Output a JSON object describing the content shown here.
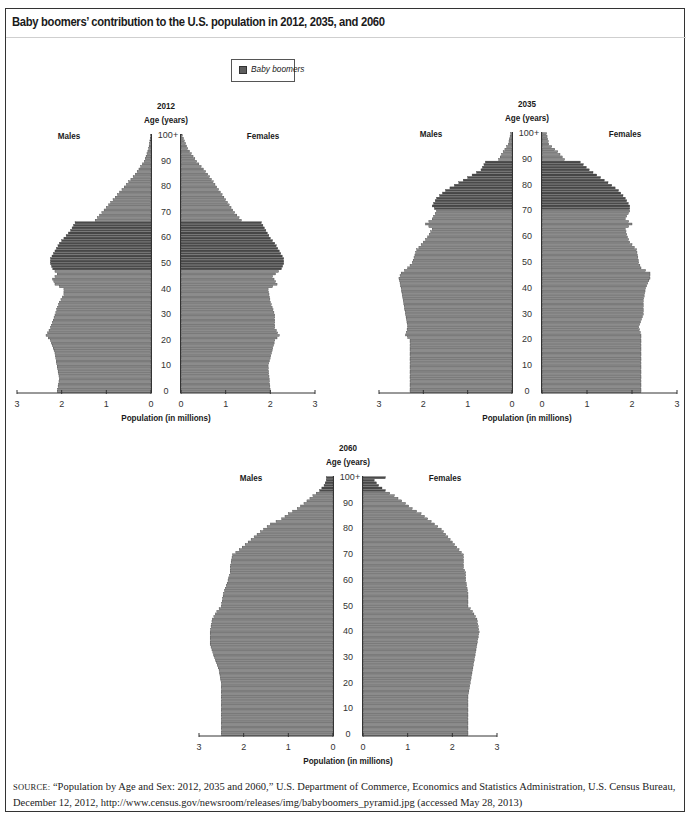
{
  "figure": {
    "title": "Baby boomers’ contribution to the U.S. population in 2012, 2035, and 2060",
    "legend": {
      "label": "Baby boomers",
      "swatch_color": "#5e5e5e"
    },
    "source_label": "SOURCE:",
    "source_text": "“Population by Age and Sex: 2012, 2035 and 2060,” U.S. Department of Commerce, Economics and Statistics Administration, U.S. Census Bureau, December 12, 2012, http://www.census.gov/newsroom/releases/img/babyboomers_pyramid.jpg (accessed May 28, 2013)"
  },
  "labels": {
    "age_axis": "Age (years)",
    "males": "Males",
    "females": "Females",
    "pop_axis": "Population (in millions)",
    "age_ticks": [
      "0",
      "10",
      "20",
      "30",
      "40",
      "50",
      "60",
      "70",
      "80",
      "90",
      "100+"
    ],
    "pop_ticks_left": [
      "3",
      "2",
      "1",
      "0"
    ],
    "pop_ticks_right": [
      "0",
      "1",
      "2",
      "3"
    ]
  },
  "colors": {
    "bar": "#8c8c8c",
    "bar_stroke": "#333333",
    "boomer": "#4a4a4a",
    "axis": "#333333"
  },
  "chart_data": [
    {
      "type": "bar",
      "subtype": "population-pyramid",
      "title": "2012",
      "xlabel": "Population (in millions)",
      "ylabel": "Age (years)",
      "xlim": [
        0,
        3
      ],
      "age_range": [
        0,
        100
      ],
      "boomer_ages": [
        48,
        66
      ],
      "series": [
        {
          "name": "Males",
          "keyframes": [
            [
              0,
              2.1
            ],
            [
              5,
              2.05
            ],
            [
              10,
              2.1
            ],
            [
              15,
              2.15
            ],
            [
              20,
              2.25
            ],
            [
              22,
              2.35
            ],
            [
              25,
              2.25
            ],
            [
              30,
              2.15
            ],
            [
              35,
              2.05
            ],
            [
              38,
              1.95
            ],
            [
              40,
              1.95
            ],
            [
              42,
              2.15
            ],
            [
              44,
              2.2
            ],
            [
              46,
              2.1
            ],
            [
              48,
              2.2
            ],
            [
              50,
              2.25
            ],
            [
              52,
              2.25
            ],
            [
              55,
              2.15
            ],
            [
              58,
              2.05
            ],
            [
              60,
              1.95
            ],
            [
              63,
              1.8
            ],
            [
              66,
              1.7
            ],
            [
              67,
              1.25
            ],
            [
              70,
              1.1
            ],
            [
              75,
              0.85
            ],
            [
              80,
              0.6
            ],
            [
              85,
              0.35
            ],
            [
              90,
              0.15
            ],
            [
              95,
              0.05
            ],
            [
              100,
              0.01
            ]
          ]
        },
        {
          "name": "Females",
          "keyframes": [
            [
              0,
              2.0
            ],
            [
              10,
              1.95
            ],
            [
              20,
              2.1
            ],
            [
              22,
              2.2
            ],
            [
              25,
              2.1
            ],
            [
              30,
              2.1
            ],
            [
              35,
              2.0
            ],
            [
              40,
              1.95
            ],
            [
              42,
              2.15
            ],
            [
              45,
              2.05
            ],
            [
              48,
              2.25
            ],
            [
              50,
              2.3
            ],
            [
              52,
              2.3
            ],
            [
              55,
              2.2
            ],
            [
              58,
              2.1
            ],
            [
              60,
              2.0
            ],
            [
              63,
              1.9
            ],
            [
              66,
              1.8
            ],
            [
              67,
              1.35
            ],
            [
              70,
              1.2
            ],
            [
              75,
              1.0
            ],
            [
              80,
              0.8
            ],
            [
              85,
              0.6
            ],
            [
              90,
              0.35
            ],
            [
              95,
              0.15
            ],
            [
              100,
              0.03
            ]
          ]
        }
      ],
      "layout": {
        "left": 10,
        "top": 98,
        "axis_y": 393,
        "age100_y": 137,
        "lz": 151,
        "l3": 17,
        "rz": 181,
        "r3": 315
      }
    },
    {
      "type": "bar",
      "subtype": "population-pyramid",
      "title": "2035",
      "xlabel": "Population (in millions)",
      "ylabel": "Age (years)",
      "xlim": [
        0,
        3
      ],
      "age_range": [
        0,
        100
      ],
      "boomer_ages": [
        71,
        89
      ],
      "series": [
        {
          "name": "Males",
          "keyframes": [
            [
              0,
              2.3
            ],
            [
              20,
              2.3
            ],
            [
              22,
              2.4
            ],
            [
              25,
              2.35
            ],
            [
              30,
              2.4
            ],
            [
              35,
              2.45
            ],
            [
              40,
              2.5
            ],
            [
              44,
              2.55
            ],
            [
              46,
              2.5
            ],
            [
              48,
              2.35
            ],
            [
              50,
              2.25
            ],
            [
              55,
              2.15
            ],
            [
              58,
              2.0
            ],
            [
              60,
              1.9
            ],
            [
              63,
              1.8
            ],
            [
              65,
              1.95
            ],
            [
              67,
              1.8
            ],
            [
              70,
              1.7
            ],
            [
              72,
              1.8
            ],
            [
              75,
              1.7
            ],
            [
              78,
              1.5
            ],
            [
              80,
              1.3
            ],
            [
              83,
              1.0
            ],
            [
              86,
              0.7
            ],
            [
              89,
              0.6
            ],
            [
              90,
              0.3
            ],
            [
              93,
              0.2
            ],
            [
              96,
              0.08
            ],
            [
              100,
              0.03
            ]
          ]
        },
        {
          "name": "Females",
          "keyframes": [
            [
              0,
              2.2
            ],
            [
              20,
              2.2
            ],
            [
              22,
              2.2
            ],
            [
              25,
              2.15
            ],
            [
              30,
              2.25
            ],
            [
              35,
              2.25
            ],
            [
              40,
              2.3
            ],
            [
              44,
              2.4
            ],
            [
              46,
              2.4
            ],
            [
              48,
              2.2
            ],
            [
              50,
              2.15
            ],
            [
              55,
              2.1
            ],
            [
              58,
              1.95
            ],
            [
              60,
              1.9
            ],
            [
              63,
              1.85
            ],
            [
              65,
              2.0
            ],
            [
              67,
              1.85
            ],
            [
              70,
              1.95
            ],
            [
              72,
              1.95
            ],
            [
              75,
              1.85
            ],
            [
              78,
              1.7
            ],
            [
              80,
              1.55
            ],
            [
              83,
              1.3
            ],
            [
              86,
              1.05
            ],
            [
              89,
              0.85
            ],
            [
              90,
              0.5
            ],
            [
              93,
              0.35
            ],
            [
              96,
              0.15
            ],
            [
              100,
              0.1
            ]
          ]
        }
      ],
      "layout": {
        "left": 372,
        "top": 98,
        "axis_y": 393,
        "age100_y": 135,
        "lz": 512,
        "l3": 379,
        "rz": 542,
        "r3": 677
      }
    },
    {
      "type": "bar",
      "subtype": "population-pyramid",
      "title": "2060",
      "xlabel": "Population (in millions)",
      "ylabel": "Age (years)",
      "xlim": [
        0,
        3
      ],
      "age_range": [
        0,
        100
      ],
      "boomer_ages": [
        95,
        100
      ],
      "series": [
        {
          "name": "Males",
          "keyframes": [
            [
              0,
              2.5
            ],
            [
              15,
              2.5
            ],
            [
              20,
              2.5
            ],
            [
              25,
              2.55
            ],
            [
              30,
              2.65
            ],
            [
              35,
              2.75
            ],
            [
              40,
              2.75
            ],
            [
              45,
              2.7
            ],
            [
              48,
              2.6
            ],
            [
              50,
              2.5
            ],
            [
              55,
              2.45
            ],
            [
              60,
              2.35
            ],
            [
              63,
              2.3
            ],
            [
              65,
              2.3
            ],
            [
              70,
              2.25
            ],
            [
              72,
              2.1
            ],
            [
              75,
              1.9
            ],
            [
              78,
              1.7
            ],
            [
              80,
              1.55
            ],
            [
              82,
              1.4
            ],
            [
              84,
              1.15
            ],
            [
              86,
              1.0
            ],
            [
              88,
              0.8
            ],
            [
              90,
              0.65
            ],
            [
              93,
              0.45
            ],
            [
              95,
              0.3
            ],
            [
              97,
              0.2
            ],
            [
              99,
              0.15
            ],
            [
              100,
              0.15
            ]
          ]
        },
        {
          "name": "Females",
          "keyframes": [
            [
              0,
              2.35
            ],
            [
              15,
              2.35
            ],
            [
              20,
              2.4
            ],
            [
              25,
              2.45
            ],
            [
              30,
              2.5
            ],
            [
              35,
              2.55
            ],
            [
              40,
              2.6
            ],
            [
              45,
              2.55
            ],
            [
              48,
              2.45
            ],
            [
              50,
              2.35
            ],
            [
              55,
              2.35
            ],
            [
              60,
              2.3
            ],
            [
              63,
              2.3
            ],
            [
              65,
              2.25
            ],
            [
              70,
              2.25
            ],
            [
              72,
              2.15
            ],
            [
              75,
              2.0
            ],
            [
              78,
              1.85
            ],
            [
              80,
              1.75
            ],
            [
              82,
              1.6
            ],
            [
              84,
              1.45
            ],
            [
              86,
              1.3
            ],
            [
              88,
              1.1
            ],
            [
              90,
              0.95
            ],
            [
              93,
              0.7
            ],
            [
              95,
              0.5
            ],
            [
              97,
              0.35
            ],
            [
              99,
              0.25
            ],
            [
              100,
              0.5
            ]
          ]
        }
      ],
      "layout": {
        "left": 192,
        "top": 441,
        "axis_y": 736,
        "age100_y": 479,
        "lz": 333,
        "l3": 199,
        "rz": 363,
        "r3": 497
      }
    }
  ]
}
